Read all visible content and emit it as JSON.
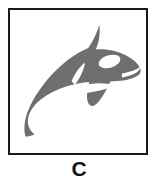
{
  "figure": {
    "caption": "C",
    "frame": {
      "border_color": "#1a1a1a",
      "border_width_px": 2,
      "background_color": "#ffffff"
    },
    "illustration": {
      "subject": "orca-killer-whale",
      "alt_text": "Gray silhouette of a leaping orca (killer whale) facing right",
      "body_color": "#6f6f6f",
      "marking_color": "#ffffff",
      "outline_color": "#6f6f6f",
      "parts": [
        {
          "name": "body",
          "label": "Body"
        },
        {
          "name": "dorsal-fin",
          "label": "Dorsal fin"
        },
        {
          "name": "tail-fluke",
          "label": "Tail fluke"
        },
        {
          "name": "pectoral-fin",
          "label": "Pectoral fin"
        },
        {
          "name": "eye-patch",
          "label": "White eye patch"
        },
        {
          "name": "belly-patch",
          "label": "White belly and flank patch"
        },
        {
          "name": "saddle-patch",
          "label": "White saddle notch"
        }
      ]
    }
  },
  "colors": {
    "orca_gray": "#6f6f6f",
    "frame_black": "#1a1a1a",
    "white": "#ffffff",
    "caption_black": "#111111"
  }
}
